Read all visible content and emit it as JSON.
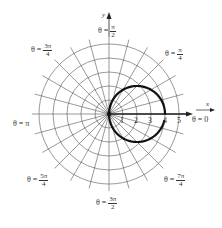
{
  "chart_data": {
    "type": "line",
    "subtype": "polar",
    "title": "",
    "curve": {
      "description": "circle r = 4cos(theta), center (2,0), radius 2, drawn with small gap just below theta = 0",
      "center": [
        2,
        0
      ],
      "radius": 2,
      "start_angle_deg": 0,
      "end_angle_deg": 346,
      "color": "#111111"
    },
    "radial_ticks": [
      "1",
      "2",
      "3",
      "4",
      "5"
    ],
    "radial_max": 5,
    "spoke_step_deg": 15,
    "axis_labels": {
      "x": "x",
      "y": "y"
    },
    "angle_labels": {
      "zero": {
        "lhs": "θ =",
        "value": "0"
      },
      "pi_over_4": {
        "lhs": "θ =",
        "num": "π",
        "den": "4"
      },
      "pi_over_2": {
        "lhs": "θ =",
        "num": "π",
        "den": "2"
      },
      "three_pi_over_4": {
        "lhs": "θ =",
        "num": "3π",
        "den": "4"
      },
      "pi": {
        "lhs": "θ =",
        "value": "π"
      },
      "five_pi_over_4": {
        "lhs": "θ =",
        "num": "5π",
        "den": "4"
      },
      "three_pi_over_2": {
        "lhs": "θ =",
        "num": "3π",
        "den": "2"
      },
      "seven_pi_over_4": {
        "lhs": "θ =",
        "num": "7π",
        "den": "4"
      }
    },
    "grid": true,
    "colors": {
      "grid": "#555555",
      "axis": "#222222",
      "curve": "#111111"
    }
  }
}
